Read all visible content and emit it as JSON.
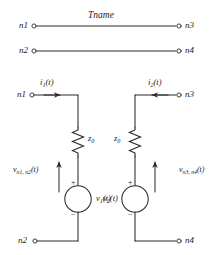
{
  "diagram": {
    "title": "Tname",
    "top_ports": {
      "line1": {
        "left_node": "n1",
        "right_node": "n3"
      },
      "line2": {
        "left_node": "n2",
        "right_node": "n4"
      }
    },
    "left_circuit": {
      "top_node": "n1",
      "bottom_node": "n2",
      "current_label": "i",
      "current_sub": "1",
      "current_arg": "(t)",
      "impedance": "z",
      "impedance_sub": "0",
      "source_label": "v",
      "source_sub": "1",
      "source_arg": "(t)",
      "port_voltage": "v",
      "port_voltage_sub": "n1, n2",
      "port_voltage_arg": "(t)",
      "plus_sign": "+",
      "minus_sign": "−"
    },
    "right_circuit": {
      "top_node": "n3",
      "bottom_node": "n4",
      "current_label": "i",
      "current_sub": "2",
      "current_arg": "(t)",
      "impedance": "z",
      "impedance_sub": "0",
      "source_label": "v",
      "source_sub": "2",
      "source_arg": "(t)",
      "port_voltage": "v",
      "port_voltage_sub": "n3, n4",
      "port_voltage_arg": "(t)",
      "plus_sign": "+",
      "minus_sign": "−"
    },
    "colors": {
      "wire": "#2b2b2b",
      "text": "#1a1a1a",
      "background": "#ffffff"
    }
  }
}
